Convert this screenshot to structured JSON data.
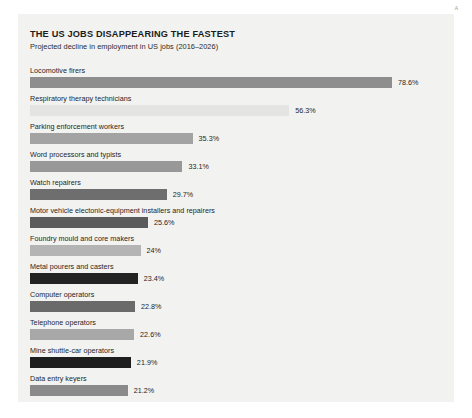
{
  "corner_mark": "A",
  "chart_data": {
    "type": "bar",
    "title": "THE US JOBS DISAPPEARING THE FASTEST",
    "subtitle": "Projected decline in employment in US jobs (2016–2026)",
    "xlabel": "",
    "ylabel": "",
    "orientation": "horizontal",
    "grid": false,
    "legend": "none",
    "value_suffix": "%",
    "xlim": [
      0,
      78.6
    ],
    "categories": [
      "Locomotive firers",
      "Respiratory therapy technicians",
      "Parking enforcement workers",
      "Word processors and typists",
      "Watch repairers",
      "Motor vehicle electonic-equipment installers and repairers",
      "Foundry mould and core makers",
      "Metal pourers and casters",
      "Computer operators",
      "Telephone operators",
      "Mine shuttle-car operators",
      "Data entry keyers"
    ],
    "values": [
      78.6,
      56.3,
      35.3,
      33.1,
      29.7,
      25.6,
      24,
      23.4,
      22.8,
      22.6,
      21.9,
      21.2
    ],
    "value_labels": [
      "78.6%",
      "56.3%",
      "35.3%",
      "33.1%",
      "29.7%",
      "25.6%",
      "24%",
      "23.4%",
      "22.8%",
      "22.6%",
      "21.9%",
      "21.2%"
    ],
    "bar_colors": [
      "#8e8e8e",
      "#e4e4e2",
      "#a3a3a3",
      "#989898",
      "#6e6e6e",
      "#5b5b5b",
      "#b4b4b4",
      "#232323",
      "#6a6a6a",
      "#a8a8a8",
      "#1e1e1e",
      "#8a8a8a"
    ],
    "bars": [
      {
        "label": "Locomotive firers",
        "value": 78.6,
        "value_label": "78.6%",
        "color": "#8e8e8e"
      },
      {
        "label": "Respiratory therapy technicians",
        "value": 56.3,
        "value_label": "56.3%",
        "color": "#e4e4e2"
      },
      {
        "label": "Parking enforcement workers",
        "value": 35.3,
        "value_label": "35.3%",
        "color": "#a3a3a3"
      },
      {
        "label": "Word processors and typists",
        "value": 33.1,
        "value_label": "33.1%",
        "color": "#989898"
      },
      {
        "label": "Watch repairers",
        "value": 29.7,
        "value_label": "29.7%",
        "color": "#6e6e6e"
      },
      {
        "label": "Motor vehicle electonic-equipment installers and repairers",
        "value": 25.6,
        "value_label": "25.6%",
        "color": "#5b5b5b"
      },
      {
        "label": "Foundry mould and core makers",
        "value": 24,
        "value_label": "24%",
        "color": "#b4b4b4"
      },
      {
        "label": "Metal pourers and casters",
        "value": 23.4,
        "value_label": "23.4%",
        "color": "#232323"
      },
      {
        "label": "Computer operators",
        "value": 22.8,
        "value_label": "22.8%",
        "color": "#6a6a6a"
      },
      {
        "label": "Telephone operators",
        "value": 22.6,
        "value_label": "22.6%",
        "color": "#a8a8a8"
      },
      {
        "label": "Mine shuttle-car operators",
        "value": 21.9,
        "value_label": "21.9%",
        "color": "#1e1e1e"
      },
      {
        "label": "Data entry keyers",
        "value": 21.2,
        "value_label": "21.2%",
        "color": "#8a8a8a"
      }
    ]
  }
}
